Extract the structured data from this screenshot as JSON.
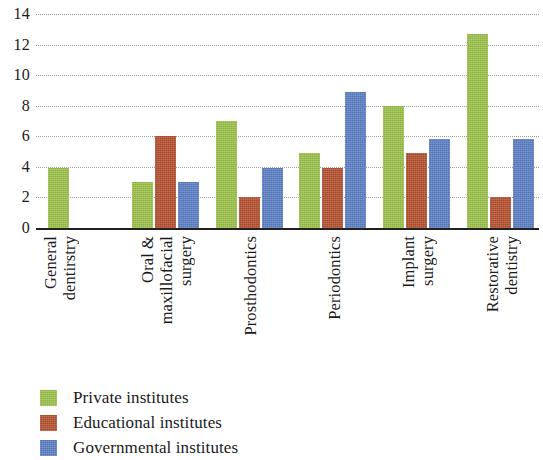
{
  "chart_data": {
    "type": "bar",
    "title": "",
    "xlabel": "",
    "ylabel": "",
    "ylim": [
      0,
      14
    ],
    "yticks": [
      0,
      2,
      4,
      6,
      8,
      10,
      12,
      14
    ],
    "grid": true,
    "legend_position": "bottom-left",
    "categories": [
      "General dentirstry",
      "Oral & maxillofacial surgery",
      "Prosthodontics",
      "Periodontics",
      "Implant surgery",
      "Restorative dentistry"
    ],
    "category_lines": [
      [
        "General",
        "dentirstry"
      ],
      [
        "Oral &",
        "maxillofacial",
        "surgery"
      ],
      [
        "Prosthodontics"
      ],
      [
        "Periodontics"
      ],
      [
        "Implant",
        "surgery"
      ],
      [
        "Restorative",
        "dentistry"
      ]
    ],
    "series": [
      {
        "name": "Private institutes",
        "color": "#9bc24a",
        "values": [
          3.9,
          3.0,
          7.0,
          4.9,
          8.0,
          12.7
        ]
      },
      {
        "name": "Educational institutes",
        "color": "#b5502f",
        "values": [
          0,
          6.0,
          2.0,
          3.9,
          4.9,
          2.0
        ]
      },
      {
        "name": "Governmental institutes",
        "color": "#5b7fc4",
        "values": [
          0,
          3.0,
          3.9,
          8.9,
          5.8,
          5.8
        ]
      }
    ]
  },
  "legend": {
    "items": [
      {
        "label": "Private institutes",
        "color": "#9bc24a"
      },
      {
        "label": "Educational institutes",
        "color": "#b5502f"
      },
      {
        "label": "Governmental institutes",
        "color": "#5b7fc4"
      }
    ]
  }
}
